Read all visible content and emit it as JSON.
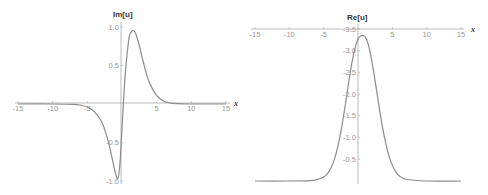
{
  "chart_data": [
    {
      "type": "line",
      "title": "",
      "ylabel": "Im[u]",
      "xlabel": "x",
      "xlim": [
        -15,
        15
      ],
      "ylim": [
        -1.0,
        1.0
      ],
      "xticks": [
        -15,
        -10,
        -5,
        5,
        10,
        15
      ],
      "xtick_labels": [
        "-15",
        "-10",
        "-5",
        "5",
        "10",
        "15"
      ],
      "yticks": [
        1.0,
        0.5,
        -0.5,
        -1.0
      ],
      "ytick_labels": [
        "1.0",
        "0.5",
        "-0.5",
        "-1.0"
      ],
      "grid": false,
      "series": [
        {
          "name": "Im[u]",
          "color": "#8c8c8c",
          "x": [
            -15,
            -10,
            -7,
            -6,
            -5,
            -4,
            -3,
            -2.5,
            -2,
            -1.5,
            -1,
            -0.6,
            -0.3,
            0,
            0.2,
            0.5,
            1,
            1.4,
            1.7,
            2,
            2.5,
            3,
            3.5,
            4,
            5,
            6,
            7,
            8,
            10,
            15
          ],
          "y": [
            0,
            0,
            -0.005,
            -0.015,
            -0.04,
            -0.1,
            -0.22,
            -0.33,
            -0.48,
            -0.67,
            -0.88,
            -0.97,
            -0.78,
            -0.32,
            0.0,
            0.42,
            0.85,
            0.94,
            0.95,
            0.91,
            0.76,
            0.57,
            0.4,
            0.27,
            0.11,
            0.04,
            0.012,
            0.004,
            0,
            0
          ]
        }
      ]
    },
    {
      "type": "line",
      "title": "",
      "ylabel": "Re[u]",
      "xlabel": "x",
      "xlim": [
        -15,
        15
      ],
      "ylim": [
        -3.5,
        0
      ],
      "xticks": [
        -15,
        -10,
        -5,
        5,
        10,
        15
      ],
      "xtick_labels": [
        "-15",
        "-10",
        "-5",
        "5",
        "10",
        "15"
      ],
      "yticks": [
        -0.5,
        -1.0,
        -1.5,
        -2.0,
        -2.5,
        -3.0,
        -3.5
      ],
      "ytick_labels": [
        "-0.5",
        "-1.0",
        "-1.5",
        "-2.0",
        "-2.5",
        "-3.0",
        "-3.5"
      ],
      "grid": false,
      "series": [
        {
          "name": "Re[u]",
          "color": "#8c8c8c",
          "x": [
            -15,
            -10,
            -7,
            -6,
            -5,
            -4.5,
            -4,
            -3.5,
            -3,
            -2.5,
            -2,
            -1.5,
            -1,
            -0.5,
            0,
            0.4,
            0.8,
            1.2,
            1.6,
            2,
            2.5,
            3,
            3.5,
            4,
            4.5,
            5,
            5.5,
            6,
            7,
            10,
            15
          ],
          "y": [
            0,
            0,
            -0.01,
            -0.03,
            -0.09,
            -0.16,
            -0.28,
            -0.47,
            -0.75,
            -1.13,
            -1.6,
            -2.12,
            -2.62,
            -3.02,
            -3.27,
            -3.34,
            -3.35,
            -3.28,
            -3.08,
            -2.78,
            -2.3,
            -1.78,
            -1.3,
            -0.9,
            -0.58,
            -0.36,
            -0.21,
            -0.12,
            -0.04,
            0,
            0
          ]
        }
      ]
    }
  ],
  "plots": {
    "left": {
      "y_axis_label": "Im[u]",
      "x_axis_label": "x"
    },
    "right": {
      "y_axis_label": "Re[u]",
      "x_axis_label": "x"
    }
  }
}
